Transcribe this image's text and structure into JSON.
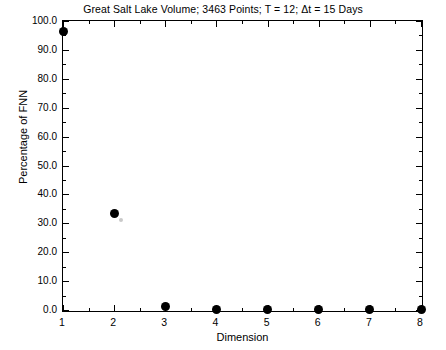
{
  "chart_data": {
    "type": "scatter",
    "title": "Great Salt Lake Volume; 3463 Points; T = 12; Δt = 15 Days",
    "xlabel": "Dimension",
    "ylabel": "Percentage of FNN",
    "x": [
      1,
      2,
      3,
      4,
      5,
      6,
      7,
      8
    ],
    "values": [
      96.5,
      33.3,
      1.1,
      0.2,
      0.2,
      0.1,
      0.1,
      0.1
    ],
    "series": [
      {
        "name": "Percentage of FNN",
        "values": [
          96.5,
          33.3,
          1.1,
          0.2,
          0.2,
          0.1,
          0.1,
          0.1
        ]
      }
    ],
    "xlim": [
      1,
      8
    ],
    "ylim": [
      0.0,
      100.0
    ],
    "xticks": [
      1,
      2,
      3,
      4,
      5,
      6,
      7,
      8
    ],
    "xtick_labels": [
      "1",
      "2",
      "3",
      "4",
      "5",
      "6",
      "7",
      "8"
    ],
    "yticks": [
      0.0,
      10.0,
      20.0,
      30.0,
      40.0,
      50.0,
      60.0,
      70.0,
      80.0,
      90.0,
      100.0
    ],
    "ytick_labels": [
      "0.0",
      "10.0",
      "20.0",
      "30.0",
      "40.0",
      "50.0",
      "60.0",
      "70.0",
      "80.0",
      "90.0",
      "100.0"
    ],
    "x_minor_ticks_between": 1,
    "y_minor_ticks_between": 1,
    "grid": false,
    "legend": null,
    "legend_position": "none",
    "marker": "filled-circle",
    "marker_color": "#000000",
    "frame": "box",
    "tick_direction": "in",
    "background_color": "#ffffff",
    "annotations": [
      {
        "name": "faint-artifact-near-dim-2",
        "x": 2.13,
        "y": 31.2,
        "color": "#c9c9c9"
      }
    ]
  }
}
